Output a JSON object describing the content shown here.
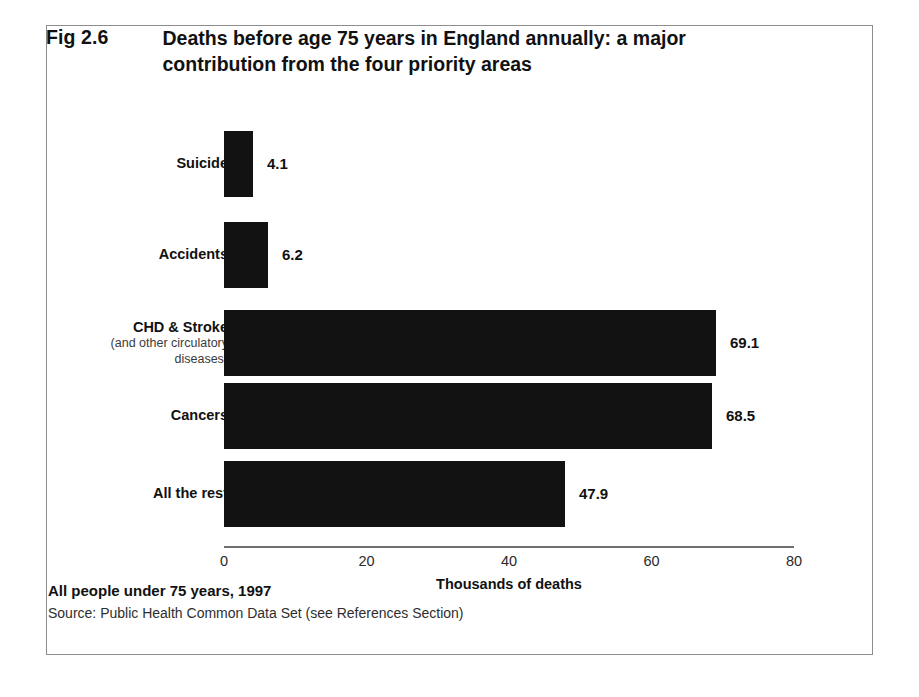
{
  "figure": {
    "number": "Fig 2.6",
    "title": "Deaths before age 75 years in England annually:  a major contribution from the four priority areas",
    "footer_main": "All people under 75 years, 1997",
    "footer_source": "Source: Public Health Common Data Set (see References Section)",
    "border_color": "#8d8d8d",
    "bar_color": "#121212",
    "background": "#ffffff"
  },
  "chart_data": {
    "type": "bar",
    "orientation": "horizontal",
    "title": "Fig 2.6 Deaths before age 75 years in England annually:  a major contribution from the four priority areas",
    "xlabel": "Thousands of deaths",
    "ylabel": "",
    "xlim": [
      0,
      80
    ],
    "xticks": [
      0,
      20,
      40,
      60,
      80
    ],
    "xtick_labels": [
      "0",
      "20",
      "40",
      "60",
      "80"
    ],
    "grid": false,
    "legend": false,
    "categories": [
      "Suicide",
      "Accidents",
      "CHD & Stroke",
      "Cancers",
      "All the rest"
    ],
    "category_sublabels": [
      "",
      "",
      "(and other circulatory diseases)",
      "",
      ""
    ],
    "values": [
      4.1,
      6.2,
      69.1,
      68.5,
      47.9
    ],
    "value_labels": [
      "4.1",
      "6.2",
      "69.1",
      "68.5",
      "47.9"
    ],
    "bars": [
      {
        "category": "Suicide",
        "sub1": "",
        "sub2": "",
        "value": 4.1,
        "label": "4.1"
      },
      {
        "category": "Accidents",
        "sub1": "",
        "sub2": "",
        "value": 6.2,
        "label": "6.2"
      },
      {
        "category": "CHD & Stroke",
        "sub1": "(and other circulatory",
        "sub2": "diseases)",
        "value": 69.1,
        "label": "69.1"
      },
      {
        "category": "Cancers",
        "sub1": "",
        "sub2": "",
        "value": 68.5,
        "label": "68.5"
      },
      {
        "category": "All the rest",
        "sub1": "",
        "sub2": "",
        "value": 47.9,
        "label": "47.9"
      }
    ]
  }
}
